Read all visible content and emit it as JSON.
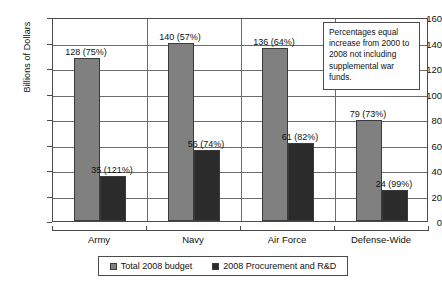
{
  "chart_data": {
    "type": "bar",
    "title": "",
    "xlabel": "",
    "ylabel": "Billions of Dollars",
    "ylim": [
      0,
      160
    ],
    "ytick_values": [
      0,
      20,
      40,
      60,
      80,
      100,
      120,
      140,
      160
    ],
    "ytick_labels": [
      "0",
      "20",
      "40",
      "60",
      "80",
      "100",
      "120",
      "140",
      "160"
    ],
    "grid": true,
    "grid_axis": "y",
    "legend_position": "bottom",
    "categories": [
      "Army",
      "Navy",
      "Air Force",
      "Defense-Wide"
    ],
    "series": [
      {
        "name": "Total 2008 budget",
        "color": "#808080",
        "values": [
          128,
          140,
          136,
          79
        ],
        "percent_labels": [
          "75%",
          "57%",
          "64%",
          "73%"
        ],
        "data_labels": [
          "128 (75%)",
          "140 (57%)",
          "136 (64%)",
          "79 (73%)"
        ]
      },
      {
        "name": "2008 Procurement and R&D",
        "color": "#2b2b2b",
        "values": [
          35,
          56,
          61,
          24
        ],
        "percent_labels": [
          "121%",
          "74%",
          "82%",
          "99%"
        ],
        "data_labels": [
          "35 (121%)",
          "56 (74%)",
          "61 (82%)",
          "24 (99%)"
        ]
      }
    ],
    "annotation": "Percentages equal increase from 2000 to 2008 not including supplemental war funds."
  },
  "legend": {
    "items": [
      {
        "label": "Total 2008 budget",
        "color": "#808080"
      },
      {
        "label": "2008 Procurement and R&D",
        "color": "#2b2b2b"
      }
    ]
  },
  "colors": {
    "total_budget": "#808080",
    "procurement": "#2b2b2b",
    "frame": "#4a4a4a",
    "gridline": "#6b6b6b",
    "background": "#ffffff",
    "text": "#111111"
  }
}
